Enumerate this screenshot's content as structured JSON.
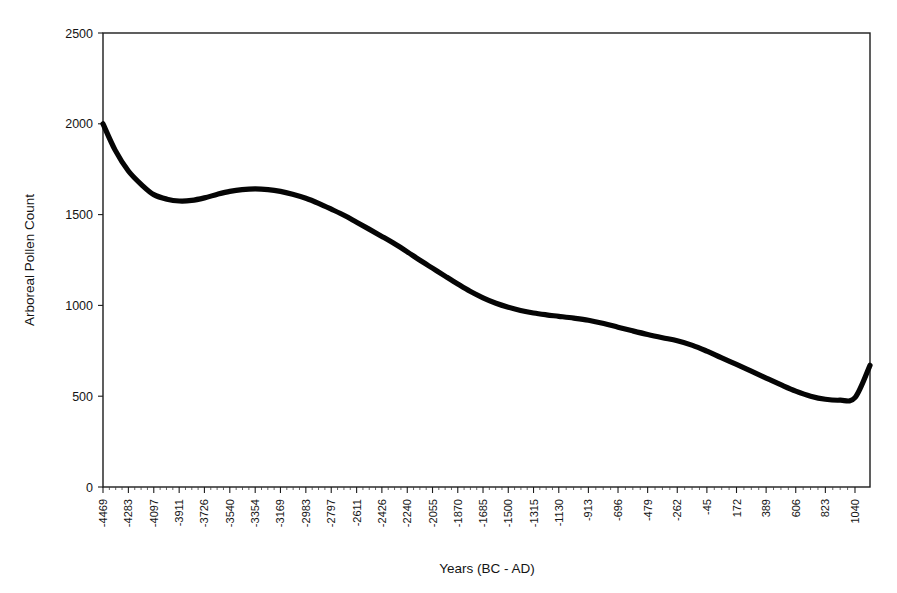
{
  "figure": {
    "background_color": "#ffffff",
    "line_color": "#050505"
  },
  "chart_data": {
    "type": "line",
    "title": "",
    "subtitle": "",
    "xlabel": "Years (BC - AD)",
    "ylabel": "Arboreal Pollen Count",
    "grid": false,
    "legend": null,
    "xlim": [
      -4469,
      1150
    ],
    "ylim": [
      0,
      2500
    ],
    "y_ticks": [
      0,
      500,
      1000,
      1500,
      2000,
      2500
    ],
    "y_tick_labels": [
      "0",
      "500",
      "1000",
      "1500",
      "2000",
      "2500"
    ],
    "x_tick_labels": [
      "-4469",
      "-4283",
      "-4097",
      "-3911",
      "-3726",
      "-3540",
      "-3354",
      "-3169",
      "-2983",
      "-2797",
      "-2611",
      "-2426",
      "-2240",
      "-2055",
      "-1870",
      "-1685",
      "-1500",
      "-1315",
      "-1130",
      "-913",
      "-696",
      "-479",
      "-262",
      "-45",
      "172",
      "389",
      "606",
      "823",
      "1040"
    ],
    "x_ticks": [
      -4469,
      -4283,
      -4097,
      -3911,
      -3726,
      -3540,
      -3354,
      -3169,
      -2983,
      -2797,
      -2611,
      -2426,
      -2240,
      -2055,
      -1870,
      -1685,
      -1500,
      -1315,
      -1130,
      -913,
      -696,
      -479,
      -262,
      -45,
      172,
      389,
      606,
      823,
      1040
    ],
    "series": [
      {
        "name": "Arboreal Pollen Count",
        "x": [
          -4469,
          -4380,
          -4283,
          -4180,
          -4097,
          -4000,
          -3911,
          -3820,
          -3726,
          -3630,
          -3540,
          -3450,
          -3354,
          -3260,
          -3169,
          -3080,
          -2983,
          -2890,
          -2797,
          -2700,
          -2611,
          -2520,
          -2426,
          -2330,
          -2240,
          -2150,
          -2055,
          -1960,
          -1870,
          -1780,
          -1685,
          -1590,
          -1500,
          -1410,
          -1315,
          -1220,
          -1130,
          -1020,
          -913,
          -800,
          -696,
          -590,
          -479,
          -370,
          -262,
          -150,
          -45,
          60,
          172,
          280,
          389,
          500,
          606,
          715,
          823,
          930,
          1040,
          1150
        ],
        "y": [
          2000,
          1855,
          1740,
          1660,
          1610,
          1585,
          1575,
          1578,
          1592,
          1612,
          1628,
          1638,
          1642,
          1638,
          1628,
          1612,
          1590,
          1562,
          1530,
          1495,
          1458,
          1420,
          1380,
          1338,
          1295,
          1250,
          1205,
          1160,
          1118,
          1078,
          1042,
          1012,
          990,
          972,
          958,
          948,
          940,
          930,
          918,
          900,
          880,
          860,
          840,
          822,
          805,
          780,
          748,
          712,
          675,
          638,
          600,
          562,
          528,
          500,
          483,
          478,
          492,
          670
        ]
      }
    ]
  },
  "axes": {
    "y_axis_label": "Arboreal Pollen Count",
    "x_axis_label": "Years (BC - AD)"
  }
}
